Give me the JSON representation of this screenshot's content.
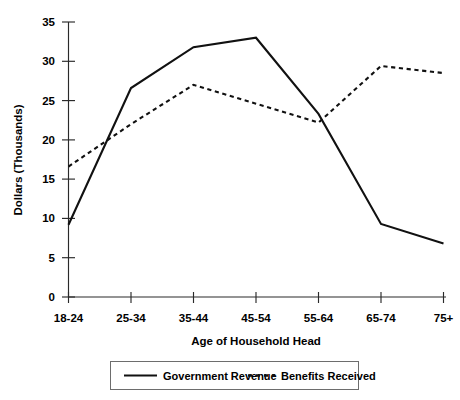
{
  "chart_data": {
    "type": "line",
    "title": "",
    "xlabel": "Age of Household Head",
    "ylabel": "Dollars (Thousands)",
    "categories": [
      "18-24",
      "25-34",
      "35-44",
      "45-54",
      "55-64",
      "65-74",
      "75+"
    ],
    "ylim": [
      0,
      35
    ],
    "yticks": [
      0,
      5,
      10,
      15,
      20,
      25,
      30,
      35
    ],
    "ytick_labels": [
      "0",
      "5",
      "10",
      "15",
      "20",
      "25",
      "30",
      "35"
    ],
    "grid": false,
    "legend_position": "bottom",
    "series": [
      {
        "name": "Government Revenue",
        "style": "solid",
        "values": [
          9.2,
          26.6,
          31.8,
          33.0,
          23.3,
          9.3,
          6.8
        ]
      },
      {
        "name": "Benefits Received",
        "style": "dotted",
        "values": [
          16.6,
          22.0,
          27.0,
          24.6,
          22.2,
          29.4,
          28.5
        ]
      }
    ]
  },
  "axes": {
    "y_title": "Dollars (Thousands)",
    "x_title": "Age of Household Head"
  },
  "legend": {
    "items": [
      {
        "label": "Government Revenue",
        "style": "solid"
      },
      {
        "label": "Benefits Received",
        "style": "dotted"
      }
    ]
  },
  "colors": {
    "series_line": "#111111",
    "axis": "#2a2a2a",
    "legend_border": "#6d6d6d",
    "background": "#ffffff"
  }
}
